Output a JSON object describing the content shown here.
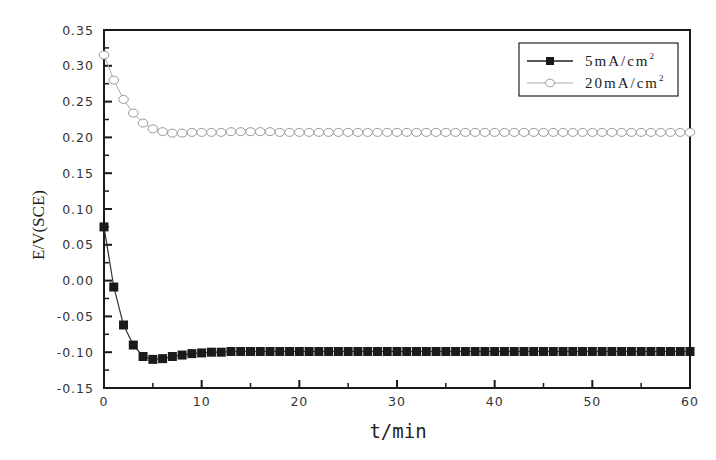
{
  "chart_data": {
    "type": "line",
    "title": "",
    "xlabel": "t/min",
    "ylabel": "E/V(SCE)",
    "xlim": [
      0,
      60
    ],
    "ylim": [
      -0.15,
      0.35
    ],
    "x_ticks": [
      "0",
      "10",
      "20",
      "30",
      "40",
      "50",
      "60"
    ],
    "y_ticks": [
      "0.35",
      "0.30",
      "0.25",
      "0.20",
      "0.15",
      "0.10",
      "0.05",
      "0.00",
      "-0.05",
      "-0.10",
      "-0.15"
    ],
    "grid": false,
    "legend_position": "upper right",
    "x": [
      0,
      1,
      2,
      3,
      4,
      5,
      6,
      7,
      8,
      9,
      10,
      11,
      12,
      13,
      14,
      15,
      16,
      17,
      18,
      19,
      20,
      21,
      22,
      23,
      24,
      25,
      26,
      27,
      28,
      29,
      30,
      31,
      32,
      33,
      34,
      35,
      36,
      37,
      38,
      39,
      40,
      41,
      42,
      43,
      44,
      45,
      46,
      47,
      48,
      49,
      50,
      51,
      52,
      53,
      54,
      55,
      56,
      57,
      58,
      59,
      60
    ],
    "series": [
      {
        "name": "5mA/cm²",
        "marker": "filled-square",
        "color": "#1a1a1a",
        "values": [
          0.075,
          -0.009,
          -0.062,
          -0.09,
          -0.106,
          -0.11,
          -0.109,
          -0.106,
          -0.104,
          -0.102,
          -0.101,
          -0.1,
          -0.1,
          -0.099,
          -0.099,
          -0.099,
          -0.099,
          -0.099,
          -0.099,
          -0.099,
          -0.099,
          -0.099,
          -0.099,
          -0.099,
          -0.099,
          -0.099,
          -0.099,
          -0.099,
          -0.099,
          -0.099,
          -0.099,
          -0.099,
          -0.099,
          -0.099,
          -0.099,
          -0.099,
          -0.099,
          -0.099,
          -0.099,
          -0.099,
          -0.099,
          -0.099,
          -0.099,
          -0.099,
          -0.099,
          -0.099,
          -0.099,
          -0.099,
          -0.099,
          -0.099,
          -0.099,
          -0.099,
          -0.099,
          -0.099,
          -0.099,
          -0.099,
          -0.099,
          -0.099,
          -0.099,
          -0.099,
          -0.099
        ]
      },
      {
        "name": "20mA/cm²",
        "marker": "open-circle",
        "color": "#999999",
        "values": [
          0.315,
          0.28,
          0.253,
          0.234,
          0.22,
          0.212,
          0.208,
          0.206,
          0.206,
          0.207,
          0.207,
          0.207,
          0.207,
          0.208,
          0.208,
          0.208,
          0.208,
          0.208,
          0.207,
          0.207,
          0.207,
          0.207,
          0.207,
          0.207,
          0.207,
          0.207,
          0.207,
          0.207,
          0.207,
          0.207,
          0.207,
          0.207,
          0.207,
          0.207,
          0.207,
          0.207,
          0.207,
          0.207,
          0.207,
          0.207,
          0.207,
          0.207,
          0.207,
          0.207,
          0.207,
          0.207,
          0.207,
          0.207,
          0.207,
          0.207,
          0.207,
          0.207,
          0.207,
          0.207,
          0.207,
          0.207,
          0.207,
          0.207,
          0.207,
          0.207,
          0.207
        ]
      }
    ]
  },
  "legend": {
    "item0": {
      "prefix": "5mA/cm",
      "sup": "2"
    },
    "item1": {
      "prefix": "20mA/cm",
      "sup": "2"
    }
  }
}
